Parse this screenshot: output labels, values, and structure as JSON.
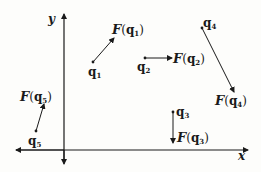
{
  "diagram": {
    "axes": {
      "x_label": "x",
      "y_label": "y"
    },
    "points": [
      {
        "id": "q1",
        "name": "q",
        "sub": "1",
        "force_label": "F",
        "force_arg": "q",
        "force_sub": "1",
        "direction": "up-right"
      },
      {
        "id": "q2",
        "name": "q",
        "sub": "2",
        "force_label": "F",
        "force_arg": "q",
        "force_sub": "2",
        "direction": "right"
      },
      {
        "id": "q3",
        "name": "q",
        "sub": "3",
        "force_label": "F",
        "force_arg": "q",
        "force_sub": "3",
        "direction": "down"
      },
      {
        "id": "q4",
        "name": "q",
        "sub": "4",
        "force_label": "F",
        "force_arg": "q",
        "force_sub": "4",
        "direction": "down-right"
      },
      {
        "id": "q5",
        "name": "q",
        "sub": "5",
        "force_label": "F",
        "force_arg": "q",
        "force_sub": "5",
        "direction": "up-slightly-right"
      }
    ],
    "colors": {
      "ink": "#1a1a1a",
      "background": "#fdfdfb"
    }
  }
}
